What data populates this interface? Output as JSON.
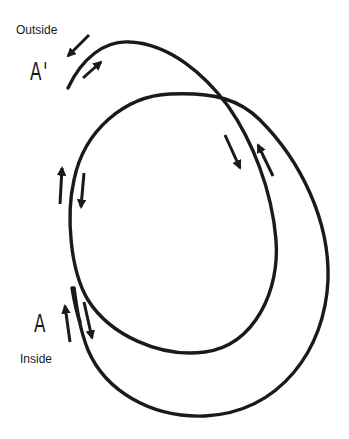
{
  "diagram": {
    "labels": {
      "outside": "Outside",
      "a_prime": "A'",
      "a": "A",
      "inside": "Inside"
    },
    "stroke_color": "#1a1a1a",
    "background": "#ffffff",
    "elements": [
      {
        "type": "spiral-curve",
        "description": "Continuous curve starting at A' (outside), arcing over the top, crossing itself, looping around inner loop and out to the outer loop ending at A (inside)"
      },
      {
        "type": "arrow-pair",
        "location": "near A'",
        "directions": [
          "down-left",
          "up-right"
        ]
      },
      {
        "type": "arrow-pair",
        "location": "upper-right crossing",
        "directions": [
          "down",
          "up"
        ]
      },
      {
        "type": "arrow-pair",
        "location": "left side of inner loop",
        "directions": [
          "up",
          "down"
        ]
      },
      {
        "type": "arrow-pair",
        "location": "near A",
        "directions": [
          "up",
          "down"
        ]
      }
    ]
  }
}
